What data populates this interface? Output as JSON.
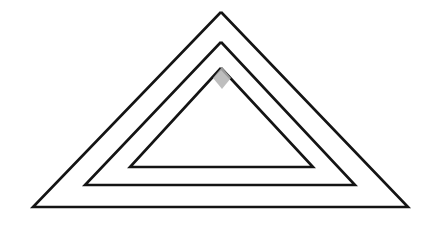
{
  "canvas": {
    "width": 439,
    "height": 233,
    "background_color": "#ffffff",
    "title": "",
    "description": "Three nested triangle outlines drawn on a blank white canvas with a small grey pointer marker near the innermost apex"
  },
  "style": {
    "stroke_color": "#141414",
    "stroke_width": 2.6,
    "fill": "none",
    "cursor_color": "#b3b3b3"
  },
  "shapes": [
    {
      "name": "outer-triangle",
      "type": "triangle",
      "label": "Outer triangle",
      "apex": {
        "x": 221,
        "y": 12
      },
      "bottom_left": {
        "x": 33,
        "y": 207
      },
      "bottom_right": {
        "x": 408,
        "y": 207
      },
      "points": "221,12 408,207 33,207 221,12"
    },
    {
      "name": "middle-triangle",
      "type": "triangle",
      "label": "Middle triangle",
      "apex": {
        "x": 221,
        "y": 42
      },
      "bottom_left": {
        "x": 85,
        "y": 185
      },
      "bottom_right": {
        "x": 355,
        "y": 185
      },
      "points": "221,42 355,185 85,185 221,42"
    },
    {
      "name": "inner-triangle",
      "type": "triangle",
      "label": "Inner triangle",
      "apex": {
        "x": 221,
        "y": 68
      },
      "bottom_left": {
        "x": 130,
        "y": 167
      },
      "bottom_right": {
        "x": 313,
        "y": 167
      },
      "points": "221,68 313,167 130,167 221,68"
    }
  ],
  "cursor": {
    "name": "pointer-marker",
    "label": "Pointer marker",
    "shape": "diamond",
    "x": 222,
    "y": 78,
    "half_width": 9,
    "half_height": 11,
    "color": "#b3b3b3",
    "points": "222,67 231,78 222,89 213,78"
  }
}
